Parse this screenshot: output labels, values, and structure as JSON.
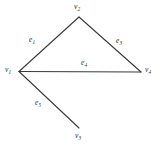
{
  "figure": {
    "background_color": "#ffffff",
    "edge_color": "#3a3a3a",
    "label_color": "#2b2b2b",
    "width": 161,
    "height": 149
  },
  "vertices": [
    {
      "id": "v1",
      "base": "v",
      "subscript": "1",
      "x": 19,
      "y": 71.5
    },
    {
      "id": "v2",
      "base": "v",
      "subscript": "2",
      "x": 79,
      "y": 17
    },
    {
      "id": "v3",
      "base": "v",
      "subscript": "3",
      "x": 79,
      "y": 128
    },
    {
      "id": "v4",
      "base": "v",
      "subscript": "4",
      "x": 141,
      "y": 72
    }
  ],
  "edges": [
    {
      "id": "e1",
      "base": "e",
      "subscript": "1",
      "from": "v1",
      "to": "v2",
      "x1": 19,
      "y1": 71.5,
      "x2": 79,
      "y2": 17
    },
    {
      "id": "e3",
      "base": "e",
      "subscript": "3",
      "from": "v2",
      "to": "v4",
      "x1": 79,
      "y1": 17,
      "x2": 141,
      "y2": 72
    },
    {
      "id": "e4",
      "base": "e",
      "subscript": "4",
      "from": "v1",
      "to": "v4",
      "x1": 19,
      "y1": 71.5,
      "x2": 141,
      "y2": 72
    },
    {
      "id": "e5",
      "base": "e",
      "subscript": "5",
      "from": "v1",
      "to": "v3",
      "x1": 19,
      "y1": 71.5,
      "x2": 79,
      "y2": 128
    }
  ],
  "labels": {
    "v1": "v",
    "v1_sub": "1",
    "v2": "v",
    "v2_sub": "2",
    "v3": "v",
    "v3_sub": "3",
    "v4": "v",
    "v4_sub": "4",
    "e1": "e",
    "e1_sub": "1",
    "e3": "e",
    "e3_sub": "3",
    "e4": "e",
    "e4_sub": "4",
    "e5": "e",
    "e5_sub": "5"
  }
}
